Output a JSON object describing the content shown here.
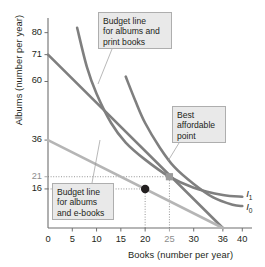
{
  "chart_data": {
    "type": "line",
    "title": "",
    "xlabel": "Books (number per year)",
    "ylabel": "Albums (number per year)",
    "xlim": [
      0,
      42
    ],
    "ylim": [
      0,
      86
    ],
    "grid": false,
    "legend_position": "inline-right",
    "xticks": [
      {
        "value": 0,
        "label": "0",
        "dim": false
      },
      {
        "value": 5,
        "label": "5",
        "dim": false
      },
      {
        "value": 10,
        "label": "10",
        "dim": false
      },
      {
        "value": 15,
        "label": "15",
        "dim": false
      },
      {
        "value": 20,
        "label": "20",
        "dim": false
      },
      {
        "value": 25,
        "label": "25",
        "dim": true
      },
      {
        "value": 30,
        "label": "30",
        "dim": false
      },
      {
        "value": 36,
        "label": "36",
        "dim": false
      },
      {
        "value": 40,
        "label": "40",
        "dim": false
      }
    ],
    "yticks": [
      {
        "value": 80,
        "label": "80",
        "dim": false
      },
      {
        "value": 71,
        "label": "71",
        "dim": false
      },
      {
        "value": 60,
        "label": "60",
        "dim": false
      },
      {
        "value": 36,
        "label": "36",
        "dim": false
      },
      {
        "value": 21,
        "label": "21",
        "dim": true
      },
      {
        "value": 16,
        "label": "16",
        "dim": false
      }
    ],
    "series": [
      {
        "name": "Budget line for albums and print books",
        "type": "line",
        "color": "#7f7f7f",
        "points": [
          [
            0,
            71
          ],
          [
            36,
            0
          ]
        ]
      },
      {
        "name": "Budget line for albums and e-books",
        "type": "line",
        "color": "#b5b5b5",
        "points": [
          [
            0,
            36
          ],
          [
            36,
            0
          ]
        ]
      },
      {
        "name": "I1",
        "type": "indifference-curve",
        "color": "#7f7f7f",
        "points": [
          [
            6,
            82
          ],
          [
            8,
            66
          ],
          [
            10,
            55
          ],
          [
            13,
            43
          ],
          [
            16,
            35
          ],
          [
            20,
            28
          ],
          [
            25,
            21
          ],
          [
            30,
            16.5
          ],
          [
            36,
            13.5
          ],
          [
            40,
            12.8
          ]
        ]
      },
      {
        "name": "I0",
        "type": "indifference-curve",
        "color": "#7f7f7f",
        "points": [
          [
            16,
            62
          ],
          [
            18,
            52
          ],
          [
            20,
            43
          ],
          [
            23,
            33
          ],
          [
            26,
            25
          ],
          [
            30,
            18
          ],
          [
            34,
            12.5
          ],
          [
            38,
            9.5
          ],
          [
            40,
            9
          ]
        ]
      }
    ],
    "markers": [
      {
        "name": "affordable-point-on-ebook-line",
        "x": 20,
        "y": 16,
        "shape": "circle",
        "color": "#231f20"
      },
      {
        "name": "best-affordable-point",
        "x": 25,
        "y": 21,
        "shape": "square",
        "color": "#9a9a9a"
      }
    ],
    "guides": [
      {
        "from": [
          0,
          21
        ],
        "to": [
          25,
          21
        ],
        "style": "dotted"
      },
      {
        "from": [
          25,
          0
        ],
        "to": [
          25,
          21
        ],
        "style": "dotted"
      },
      {
        "from": [
          0,
          16
        ],
        "to": [
          20,
          16
        ],
        "style": "dotted"
      },
      {
        "from": [
          20,
          0
        ],
        "to": [
          20,
          16
        ],
        "style": "dotted"
      }
    ],
    "curve_labels": [
      {
        "name": "I1",
        "base": "I",
        "sub": "1",
        "x": 40.8,
        "y": 13.6
      },
      {
        "name": "I0",
        "base": "I",
        "sub": "0",
        "x": 40.8,
        "y": 8.2
      }
    ],
    "annotations": [
      {
        "name": "budget-line-print-books",
        "lines": [
          "Budget line",
          "for albums and",
          "print books"
        ],
        "box": {
          "left": 98,
          "top": 12,
          "width": 74,
          "height": 37
        },
        "leader": {
          "x1": 112,
          "y1": 49,
          "x2": 98,
          "y2": 84
        }
      },
      {
        "name": "best-affordable-point",
        "lines": [
          "Best",
          "affordable",
          "point"
        ],
        "box": {
          "left": 172,
          "top": 106,
          "width": 54,
          "height": 37
        },
        "leader": {
          "x1": 179,
          "y1": 143,
          "x2": 168,
          "y2": 161
        }
      },
      {
        "name": "budget-line-e-books",
        "lines": [
          "Budget line",
          "for albums",
          "and e-books"
        ],
        "box": {
          "left": 52,
          "top": 183,
          "width": 62,
          "height": 37
        },
        "leader": {
          "x1": 92,
          "y1": 183,
          "x2": 100,
          "y2": 140
        }
      }
    ]
  },
  "axes": {
    "x_axis_label": "Books (number per year)",
    "y_axis_label": "Albums (number per year)"
  }
}
